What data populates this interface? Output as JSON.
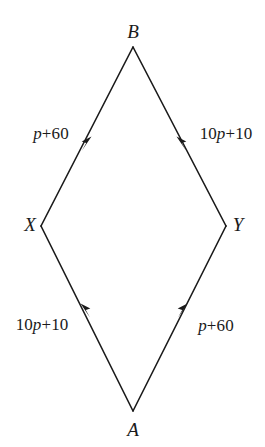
{
  "figure": {
    "type": "geometry-vector-diagram",
    "shape": "rhombus",
    "background_color": "#ffffff",
    "stroke_color": "#1a1a1a",
    "text_color": "#1a1a1a"
  },
  "vertices": {
    "top": {
      "label": "B",
      "x": 133,
      "y": 47
    },
    "left": {
      "label": "X",
      "x": 41,
      "y": 226
    },
    "right": {
      "label": "Y",
      "x": 226,
      "y": 226
    },
    "bottom": {
      "label": "A",
      "x": 133,
      "y": 411
    }
  },
  "edges": [
    {
      "name": "edge-x-to-b",
      "from": "X",
      "to": "B",
      "direction": "up-right",
      "arrow_at": {
        "x": 88,
        "y": 143
      },
      "label_prefix": "",
      "label_variable": "p",
      "label_suffix": "+60",
      "label_full": "p+60"
    },
    {
      "name": "edge-y-to-b",
      "from": "Y",
      "to": "B",
      "direction": "up-left",
      "arrow_at": {
        "x": 180,
        "y": 143
      },
      "label_prefix": "10",
      "label_variable": "p",
      "label_suffix": "+10",
      "label_full": "10p+10"
    },
    {
      "name": "edge-a-to-x",
      "from": "A",
      "to": "X",
      "direction": "up-left",
      "arrow_at": {
        "x": 85,
        "y": 311
      },
      "label_prefix": "10",
      "label_variable": "p",
      "label_suffix": "+10",
      "label_full": "10p+10"
    },
    {
      "name": "edge-a-to-y",
      "from": "A",
      "to": "Y",
      "direction": "up-right",
      "arrow_at": {
        "x": 184,
        "y": 311
      },
      "label_prefix": "",
      "label_variable": "p",
      "label_suffix": "+60",
      "label_full": "p+60"
    }
  ]
}
